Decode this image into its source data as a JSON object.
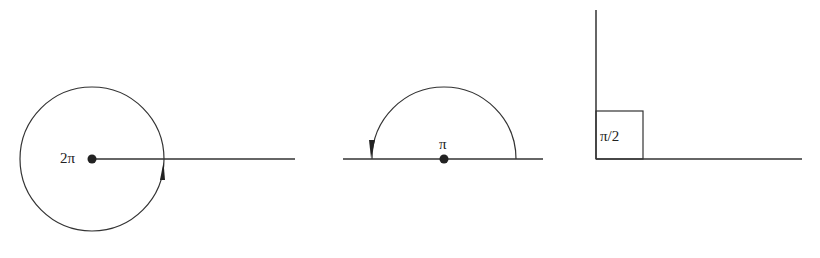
{
  "figures": [
    {
      "id": "full-turn",
      "label": "2π",
      "description": "full rotation circle"
    },
    {
      "id": "straight-angle",
      "label": "π",
      "description": "half rotation semicircle"
    },
    {
      "id": "right-angle",
      "label": "π/2",
      "description": "right angle with square marker"
    }
  ],
  "colors": {
    "stroke": "#333333",
    "background": "#ffffff"
  }
}
